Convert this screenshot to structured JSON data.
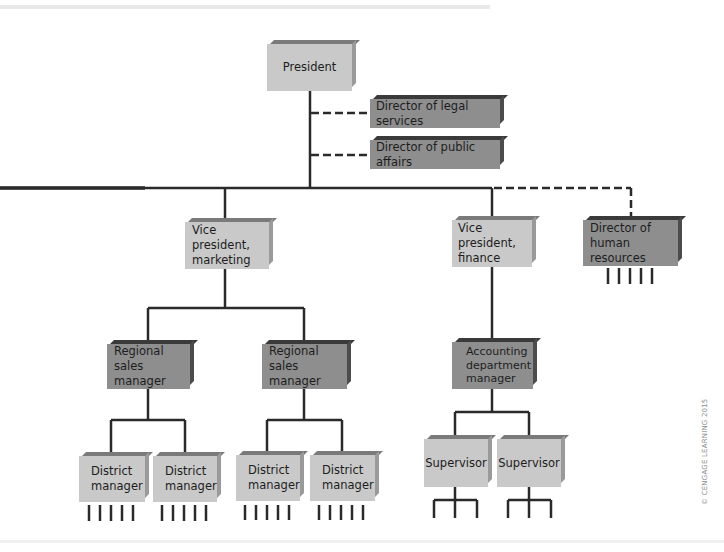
{
  "diagram": {
    "type": "organization-chart",
    "nodes": {
      "president": {
        "label": "President",
        "shade": "light"
      },
      "legal": {
        "label": "Director of legal services",
        "shade": "dark",
        "relation": "staff (dashed)"
      },
      "public_affairs": {
        "label": "Director of public affairs",
        "shade": "dark",
        "relation": "staff (dashed)"
      },
      "vp_marketing": {
        "label": "Vice president,\nmarketing",
        "shade": "light"
      },
      "vp_finance": {
        "label": "Vice president,\nfinance",
        "shade": "light"
      },
      "hr": {
        "label": "Director of\nhuman resources",
        "shade": "dark",
        "relation": "staff (dashed)"
      },
      "regional_1": {
        "label": "Regional\nsales manager",
        "shade": "dark"
      },
      "regional_2": {
        "label": "Regional\nsales manager",
        "shade": "dark"
      },
      "accounting": {
        "label": "Accounting\ndepartment\nmanager",
        "shade": "dark"
      },
      "district_1": {
        "label": "District\nmanager",
        "shade": "light"
      },
      "district_2": {
        "label": "District\nmanager",
        "shade": "light"
      },
      "district_3": {
        "label": "District\nmanager",
        "shade": "light"
      },
      "district_4": {
        "label": "District\nmanager",
        "shade": "light"
      },
      "supervisor_1": {
        "label": "Supervisor",
        "shade": "light"
      },
      "supervisor_2": {
        "label": "Supervisor",
        "shade": "light"
      }
    },
    "edges": [
      [
        "president",
        "legal",
        "dashed"
      ],
      [
        "president",
        "public_affairs",
        "dashed"
      ],
      [
        "president",
        "vp_marketing",
        "solid"
      ],
      [
        "president",
        "vp_finance",
        "solid"
      ],
      [
        "president",
        "hr",
        "dashed"
      ],
      [
        "vp_marketing",
        "regional_1",
        "solid"
      ],
      [
        "vp_marketing",
        "regional_2",
        "solid"
      ],
      [
        "regional_1",
        "district_1",
        "solid"
      ],
      [
        "regional_1",
        "district_2",
        "solid"
      ],
      [
        "regional_2",
        "district_3",
        "solid"
      ],
      [
        "regional_2",
        "district_4",
        "solid"
      ],
      [
        "vp_finance",
        "accounting",
        "solid"
      ],
      [
        "accounting",
        "supervisor_1",
        "solid"
      ],
      [
        "accounting",
        "supervisor_2",
        "solid"
      ]
    ],
    "colors": {
      "light_box": "#c9c9c9",
      "dark_box": "#8e8e8e",
      "line": "#2a2a2a"
    }
  },
  "credit": "© CENGAGE LEARNING 2015"
}
